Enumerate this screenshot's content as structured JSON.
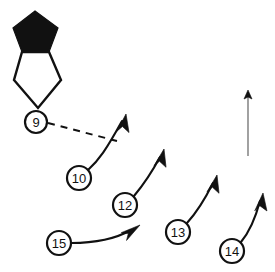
{
  "figure": {
    "background_color": "#ffffff",
    "ink_color": "#111111",
    "width": 275,
    "height": 272
  },
  "shapes": [
    {
      "name": "filled-pentagon",
      "style": "filled",
      "fill": "#111111",
      "points": "35,11 58,28 49,52 22,52 13,28"
    },
    {
      "name": "outline-pentagon",
      "style": "outline",
      "fill": "#ffffff",
      "points": "22,52 49,52 61,80 38,108 14,80"
    }
  ],
  "callouts": [
    {
      "label": "9",
      "name": "callout-9",
      "cx": 36,
      "cy": 122,
      "r": 11,
      "leader_type": "dashed",
      "leader_path": "M 48,123 L 117,141",
      "arrow": false
    },
    {
      "label": "10",
      "name": "callout-10",
      "cx": 79,
      "cy": 178,
      "r": 12,
      "leader_type": "solid-curved",
      "leader_path": "M 88,170 C 99,160 106,150 122,121",
      "arrow": true,
      "arrow_tip": "125,116",
      "arrow_angle": -62
    },
    {
      "label": "12",
      "name": "callout-12",
      "cx": 125,
      "cy": 205,
      "r": 12,
      "leader_type": "solid",
      "leader_path": "M 134,196 C 144,184 152,172 160,157",
      "arrow": true,
      "arrow_tip": "163,151",
      "arrow_angle": -62
    },
    {
      "label": "13",
      "name": "callout-13",
      "cx": 178,
      "cy": 232,
      "r": 12,
      "leader_type": "solid",
      "leader_path": "M 187,223 C 198,211 206,197 213,183",
      "arrow": true,
      "arrow_tip": "216,177",
      "arrow_angle": -62
    },
    {
      "label": "14",
      "name": "callout-14",
      "cx": 232,
      "cy": 251,
      "r": 12,
      "leader_type": "solid",
      "leader_path": "M 241,242 C 251,230 256,216 260,201",
      "arrow": true,
      "arrow_tip": "262,195",
      "arrow_angle": -70
    },
    {
      "label": "15",
      "name": "callout-15",
      "cx": 59,
      "cy": 243,
      "r": 12,
      "leader_type": "solid-curved",
      "leader_path": "M 71,243 C 95,243 117,238 131,230",
      "arrow": true,
      "arrow_tip": "137,227",
      "arrow_angle": -27
    }
  ],
  "extra_marks": [
    {
      "name": "vertical-rule",
      "description": "thin vertical leader line at right edge",
      "path": "M 248,96 L 248,156",
      "stroke": "#555555"
    },
    {
      "name": "vertical-rule-tip",
      "description": "small dark tip at top of vertical leader",
      "cx": 248,
      "cy": 94
    }
  ]
}
